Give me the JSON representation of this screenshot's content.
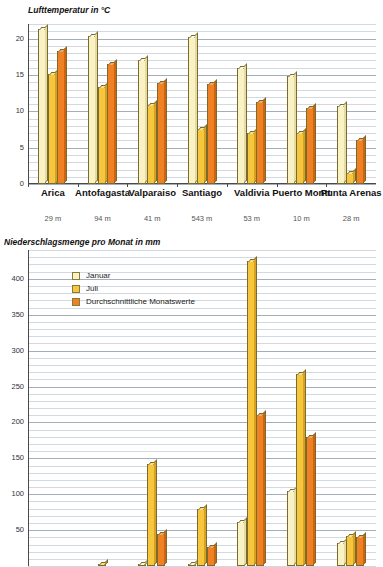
{
  "chart_data": [
    {
      "type": "bar",
      "title": "Lufttemperatur in °C",
      "xlabel": "",
      "ylabel": "",
      "ylim": [
        0,
        22
      ],
      "yticks": [
        0,
        5,
        10,
        15,
        20
      ],
      "grid": true,
      "minor_grid": true,
      "categories": [
        "Arica",
        "Antofagasta",
        "Valparaiso",
        "Santiago",
        "Valdivia",
        "Puerto Montt",
        "Punta Arenas"
      ],
      "category_sublabels": [
        "29 m",
        "94 m",
        "41 m",
        "543 m",
        "53 m",
        "10 m",
        "28 m"
      ],
      "series": [
        {
          "name": "Januar",
          "color": "#f9f2c4",
          "values": [
            21.3,
            20.4,
            17.1,
            20.2,
            16.0,
            14.8,
            10.7
          ]
        },
        {
          "name": "Juli",
          "color": "#f6c63e",
          "values": [
            15.2,
            13.3,
            10.9,
            7.6,
            7.0,
            7.0,
            1.5
          ]
        },
        {
          "name": "Durchschnittliche Monatswerte",
          "color": "#ef8024",
          "values": [
            18.3,
            16.5,
            13.9,
            13.7,
            11.3,
            10.5,
            6.0
          ]
        }
      ]
    },
    {
      "type": "bar",
      "title": "Niederschlagsmenge pro Monat in mm",
      "xlabel": "",
      "ylabel": "",
      "ylim": [
        0,
        440
      ],
      "yticks": [
        50,
        100,
        150,
        200,
        250,
        300,
        350,
        400
      ],
      "grid": true,
      "minor_grid": true,
      "categories": [
        "Arica",
        "Antofagasta",
        "Valparaiso",
        "Santiago",
        "Valdivia",
        "Puerto Montt",
        "Punta Arenas"
      ],
      "series": [
        {
          "name": "Januar",
          "color": "#f9f2c4",
          "values": [
            0,
            0,
            1,
            2,
            62,
            104,
            32
          ]
        },
        {
          "name": "Juli",
          "color": "#f6c63e",
          "values": [
            0,
            1,
            142,
            79,
            425,
            268,
            42
          ]
        },
        {
          "name": "Durchschnittliche Monatswerte",
          "color": "#ef8024",
          "values": [
            0,
            0,
            44,
            26,
            210,
            180,
            40
          ]
        }
      ],
      "legend": {
        "position": "inside-top-left",
        "entries": [
          {
            "label": "Januar",
            "color": "#f9f2c4"
          },
          {
            "label": "Juli",
            "color": "#f6c63e"
          },
          {
            "label": "Durchschnittliche Monatswerte",
            "color": "#ef8024"
          }
        ]
      }
    }
  ],
  "temperature_chart": {
    "title": "Lufttemperatur in °C",
    "yticks": [
      "0",
      "5",
      "10",
      "15",
      "20"
    ]
  },
  "precipitation_chart": {
    "title": "Niederschlagsmenge pro Monat in mm",
    "yticks": [
      "50",
      "100",
      "150",
      "200",
      "250",
      "300",
      "350",
      "400"
    ],
    "legend": {
      "januar": "Januar",
      "juli": "Juli",
      "durchschnitt": "Durchschnittliche Monatswerte"
    }
  },
  "cities": [
    {
      "name": "Arica",
      "elevation": "29 m"
    },
    {
      "name": "Antofagasta",
      "elevation": "94 m"
    },
    {
      "name": "Valparaiso",
      "elevation": "41 m"
    },
    {
      "name": "Santiago",
      "elevation": "543 m"
    },
    {
      "name": "Valdivia",
      "elevation": "53 m"
    },
    {
      "name": "Puerto Montt",
      "elevation": "10 m"
    },
    {
      "name": "Punta Arenas",
      "elevation": "28 m"
    }
  ]
}
